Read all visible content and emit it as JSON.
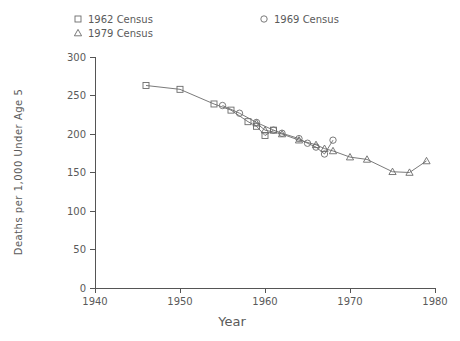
{
  "chart_data": {
    "type": "line",
    "title": "",
    "xlabel": "Year",
    "ylabel": "Deaths per 1,000 Under Age 5",
    "xlim": [
      1940,
      1980
    ],
    "ylim": [
      0,
      300
    ],
    "xticks": [
      1940,
      1950,
      1960,
      1970,
      1980
    ],
    "yticks": [
      0,
      50,
      100,
      150,
      200,
      250,
      300
    ],
    "grid": false,
    "legend_position": "top",
    "series": [
      {
        "name": "1962 Census",
        "marker": "square",
        "x": [
          1946,
          1950,
          1954,
          1956,
          1958,
          1959,
          1960,
          1961
        ],
        "y": [
          263,
          258,
          239,
          231,
          216,
          210,
          198,
          205
        ]
      },
      {
        "name": "1969 Census",
        "marker": "circle",
        "x": [
          1955,
          1957,
          1959,
          1961,
          1962,
          1964,
          1965,
          1966,
          1967,
          1968
        ],
        "y": [
          237,
          227,
          215,
          205,
          201,
          194,
          188,
          183,
          174,
          192
        ]
      },
      {
        "name": "1979 Census",
        "marker": "triangle",
        "x": [
          1959,
          1960,
          1962,
          1964,
          1966,
          1967,
          1968,
          1970,
          1972,
          1975,
          1977,
          1979
        ],
        "y": [
          214,
          205,
          200,
          192,
          186,
          181,
          178,
          170,
          167,
          151,
          150,
          165
        ]
      }
    ]
  },
  "legend": {
    "entries": [
      {
        "label": "1962 Census",
        "marker": "square",
        "x": 78,
        "y": 19
      },
      {
        "label": "1979 Census",
        "marker": "triangle",
        "x": 78,
        "y": 33
      },
      {
        "label": "1969 Census",
        "marker": "circle",
        "x": 264,
        "y": 19
      }
    ]
  },
  "axes": {
    "x_title": "Year",
    "y_title": "Deaths per 1,000 Under Age 5",
    "x_tick_labels": [
      "1940",
      "1950",
      "1960",
      "1970",
      "1980"
    ],
    "y_tick_labels": [
      "0",
      "50",
      "100",
      "150",
      "200",
      "250",
      "300"
    ]
  },
  "colors": {
    "line": "#6b6b6b",
    "axis": "#555555",
    "text": "#5a5a5a",
    "background": "#ffffff"
  }
}
